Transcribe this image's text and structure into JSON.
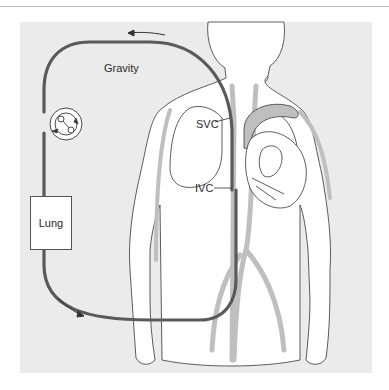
{
  "figure": {
    "labels": {
      "gravity": "Gravity",
      "svc": "SVC",
      "ivc": "IVC",
      "lung": "Lung"
    },
    "colors": {
      "background": "#ffffff",
      "panel": "#ebebeb",
      "tubing": "#5a5a5a",
      "vessel_fill": "#bfbfbf",
      "outline": "#4a4a4a",
      "body_fill": "#ffffff"
    },
    "components": [
      "pump",
      "oxygenator-lung",
      "svc-cannula",
      "ivc-cannula",
      "tubing-circuit"
    ]
  }
}
